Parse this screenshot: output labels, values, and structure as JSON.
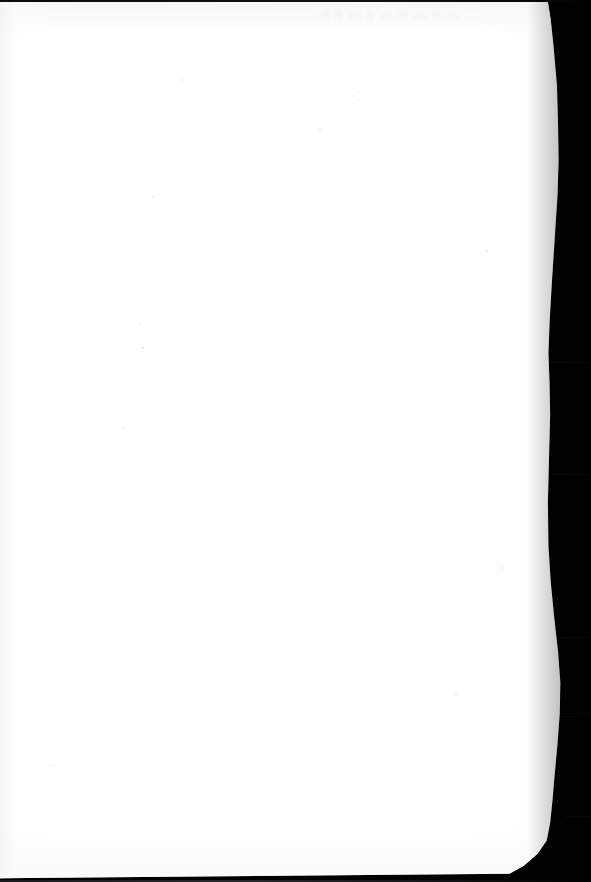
{
  "document": {
    "kind": "scanned-page",
    "content_text": "",
    "is_blank": true,
    "page_width_px": 591,
    "page_height_px": 882
  },
  "colors": {
    "paper": "#ffffff",
    "background": "#000000",
    "paper_shadow": "#0a0a0b",
    "ghost_mark": "#f2f2f4",
    "speck": "#ededf0",
    "edge_bar_top": "#121214",
    "edge_bar_bottom": "#2a2a2d"
  },
  "scan": {
    "paper_left_px": 0,
    "paper_top_px": 2,
    "paper_right_edge_px": 551,
    "paper_bottom_px": 879,
    "background_strip_label": "",
    "top_bar_height_px": 2,
    "bottom_bar_height_px": 2
  },
  "artifacts": {
    "ghost_marks": [
      {
        "left": 2,
        "top": 2,
        "width": 11,
        "height": 9
      },
      {
        "left": 17,
        "top": 1,
        "width": 8,
        "height": 10
      },
      {
        "left": 30,
        "top": 3,
        "width": 13,
        "height": 8
      },
      {
        "left": 48,
        "top": 2,
        "width": 9,
        "height": 10
      },
      {
        "left": 62,
        "top": 4,
        "width": 12,
        "height": 7
      },
      {
        "left": 80,
        "top": 1,
        "width": 10,
        "height": 10
      },
      {
        "left": 95,
        "top": 3,
        "width": 14,
        "height": 8
      },
      {
        "left": 114,
        "top": 2,
        "width": 9,
        "height": 9
      },
      {
        "left": 130,
        "top": 4,
        "width": 11,
        "height": 7
      }
    ],
    "specks": [
      {
        "left": 182,
        "top": 77,
        "size": 2
      },
      {
        "left": 140,
        "top": 322,
        "size": 2
      },
      {
        "left": 141,
        "top": 344,
        "size": 3
      },
      {
        "left": 122,
        "top": 425,
        "size": 2
      },
      {
        "left": 319,
        "top": 126,
        "size": 2
      },
      {
        "left": 353,
        "top": 93,
        "size": 2
      },
      {
        "left": 486,
        "top": 248,
        "size": 2
      },
      {
        "left": 455,
        "top": 692,
        "size": 2
      },
      {
        "left": 51,
        "top": 763,
        "size": 2
      },
      {
        "left": 152,
        "top": 194,
        "size": 2
      },
      {
        "left": 501,
        "top": 565,
        "size": 2
      }
    ],
    "bed_seams": [
      {
        "top": 362,
        "width": 42
      },
      {
        "top": 474,
        "width": 38
      },
      {
        "top": 637,
        "width": 34
      },
      {
        "top": 713,
        "width": 30
      },
      {
        "top": 816,
        "width": 26
      }
    ]
  }
}
